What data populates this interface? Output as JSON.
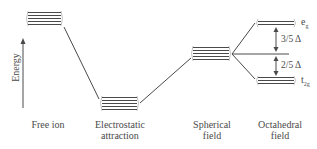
{
  "diagram": {
    "type": "crystal-field-splitting-energy-diagram",
    "y_axis_label": "Energy",
    "stages": [
      {
        "id": "free-ion",
        "label_line1": "Free ion",
        "label_line2": ""
      },
      {
        "id": "electrostatic",
        "label_line1": "Electrostatic",
        "label_line2": "attraction"
      },
      {
        "id": "spherical",
        "label_line1": "Spherical",
        "label_line2": "field"
      },
      {
        "id": "octahedral",
        "label_line1": "Octahedral",
        "label_line2": "field"
      }
    ],
    "levels": {
      "eg": {
        "label": "e",
        "subscript": "g",
        "orbitals": 2
      },
      "t2g": {
        "label": "t",
        "subscript": "2g",
        "orbitals": 3
      }
    },
    "splitting": {
      "upper": "3/5 Δ",
      "lower": "2/5 Δ"
    },
    "colors": {
      "line": "#4a4a4a",
      "text": "#4a4a4a",
      "background": "#ffffff"
    }
  }
}
